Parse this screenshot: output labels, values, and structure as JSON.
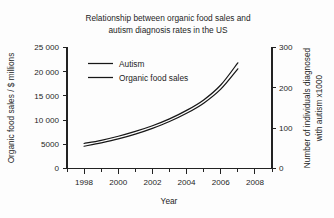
{
  "chart_data": {
    "type": "line",
    "title": "Relationship between organic food sales and autism diagnosis rates in the US",
    "title_line1": "Relationship between organic food sales and",
    "title_line2": "autism diagnosis rates in the US",
    "xlabel": "Year",
    "ylabel": "Organic food sales / $ millions",
    "ylabel_right_line1": "Number of individuals diagnosed",
    "ylabel_right_line2": "with autism x1000",
    "grid": false,
    "legend_position": "upper-left-inside",
    "xlim": [
      1997,
      2009
    ],
    "xticks": [
      1998,
      2000,
      2002,
      2004,
      2006,
      2008
    ],
    "xticklabels": [
      "1998",
      "2000",
      "2002",
      "2004",
      "2006",
      "2008"
    ],
    "xminorticks": [
      1997,
      1999,
      2001,
      2003,
      2005,
      2007,
      2009
    ],
    "ylim": [
      0,
      25000
    ],
    "yticks": [
      0,
      5000,
      10000,
      15000,
      20000,
      25000
    ],
    "yticklabels": [
      "0",
      "5000",
      "10 000",
      "15 000",
      "20 000",
      "25 000"
    ],
    "ylim_right": [
      0,
      300
    ],
    "yticks_right": [
      0,
      100,
      200,
      300
    ],
    "yticklabels_right": [
      "0",
      "100",
      "200",
      "300"
    ],
    "x": [
      1998,
      1999,
      2000,
      2001,
      2002,
      2003,
      2004,
      2005,
      2006,
      2007
    ],
    "series": [
      {
        "name": "Autism",
        "axis": "right",
        "units": "individuals diagnosed x1000",
        "color": "#171717",
        "values": [
          62,
          70,
          80,
          92,
          106,
          123,
          144,
          170,
          207,
          262
        ],
        "values_left_axis_equivalent": [
          5167,
          5833,
          6667,
          7667,
          8833,
          10250,
          12000,
          14167,
          17250,
          21833
        ]
      },
      {
        "name": "Organic food sales",
        "axis": "left",
        "units": "$ millions",
        "color": "#171717",
        "values": [
          4600,
          5300,
          6100,
          7100,
          8300,
          9700,
          11400,
          13500,
          16400,
          20600
        ]
      }
    ],
    "legend": [
      {
        "label": "Autism"
      },
      {
        "label": "Organic food sales"
      }
    ]
  }
}
